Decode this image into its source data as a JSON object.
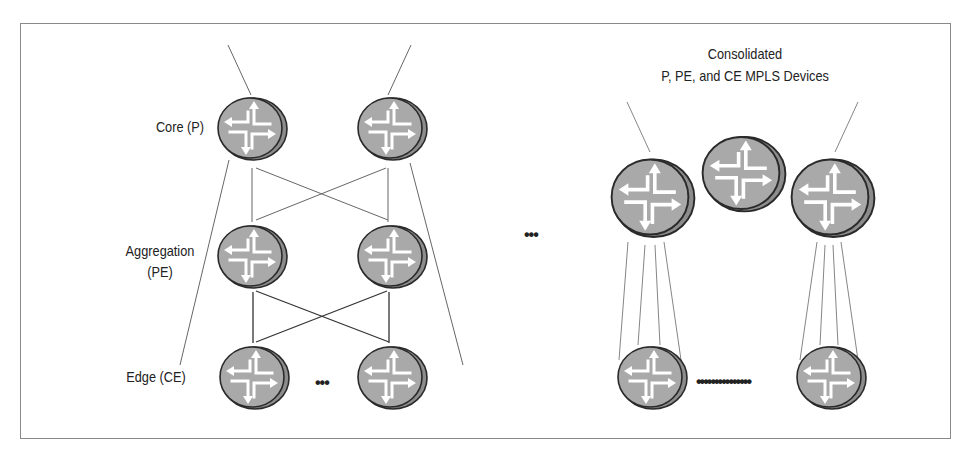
{
  "labels": {
    "core": "Core (P)",
    "aggregation_line1": "Aggregation",
    "aggregation_line2": "(PE)",
    "edge": "Edge (CE)",
    "consolidated_line1": "Consolidated",
    "consolidated_line2": "P, PE, and CE MPLS Devices"
  },
  "ellipses": {
    "between_topologies": "•••",
    "edge_left": "•••",
    "edge_right": "•••••••••••••••"
  },
  "colors": {
    "router_fill": "#a9a9a9",
    "router_side": "#8c8c8c",
    "router_outline": "#2a2a2a",
    "line": "#555555",
    "frame": "#8a8a8a"
  },
  "left_topology": {
    "tiers": [
      "Core (P)",
      "Aggregation (PE)",
      "Edge (CE)"
    ],
    "routers_per_tier": 2
  },
  "right_topology": {
    "consolidated_routers": 3,
    "edge_routers": 2
  }
}
